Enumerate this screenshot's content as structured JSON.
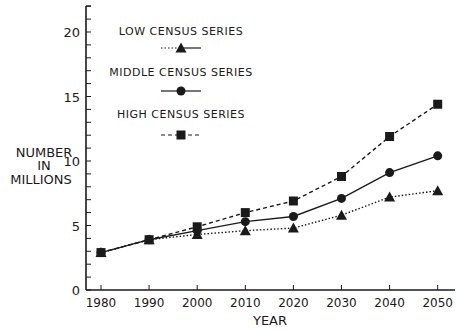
{
  "chart_data": {
    "type": "line",
    "title": "",
    "xlabel": "YEAR",
    "ylabel": [
      "NUMBER",
      "IN",
      "MILLIONS"
    ],
    "x": [
      1980,
      1990,
      2000,
      2010,
      2020,
      2030,
      2040,
      2050
    ],
    "xticks": [
      "1980",
      "1990",
      "2000",
      "2010",
      "2020",
      "2030",
      "2040",
      "2050"
    ],
    "yticks": [
      0,
      5,
      10,
      15,
      20
    ],
    "ylim": [
      0,
      22
    ],
    "grid": false,
    "legend_position": "upper-left-inside",
    "series": [
      {
        "name": "LOW CENSUS SERIES",
        "marker": "triangle",
        "line_style": "dotted",
        "values": [
          2.9,
          3.9,
          4.3,
          4.6,
          4.8,
          5.8,
          7.2,
          7.7
        ]
      },
      {
        "name": "MIDDLE CENSUS SERIES",
        "marker": "circle",
        "line_style": "solid",
        "values": [
          2.9,
          3.9,
          4.6,
          5.3,
          5.7,
          7.1,
          9.1,
          10.4
        ]
      },
      {
        "name": "HIGH CENSUS SERIES",
        "marker": "square",
        "line_style": "dashed",
        "values": [
          2.9,
          3.9,
          4.9,
          6.0,
          6.9,
          8.8,
          11.9,
          14.4
        ]
      }
    ]
  },
  "colors": {
    "ink": "#1a1a1a",
    "background": "#ffffff"
  }
}
